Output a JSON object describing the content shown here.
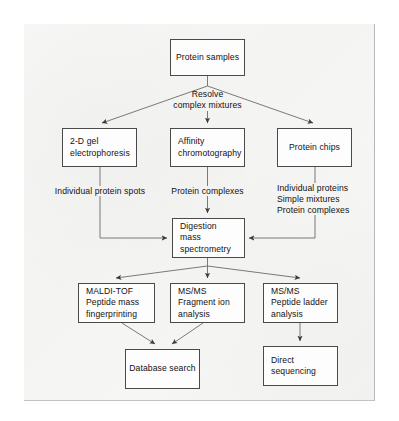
{
  "diagram": {
    "stroke_color": "#4a4a4a",
    "text_color": "#15110f",
    "panel_color": "#f5f5f4",
    "boxes": [
      {
        "id": "protein-samples",
        "lines": [
          "Protein samples"
        ]
      },
      {
        "id": "2d-gel",
        "lines": [
          "2-D gel",
          "electrophoresis"
        ]
      },
      {
        "id": "affinity",
        "lines": [
          "Affinity",
          "chromotography"
        ]
      },
      {
        "id": "protein-chips",
        "lines": [
          "Protein chips"
        ]
      },
      {
        "id": "digestion",
        "lines": [
          "Digestion",
          "mass",
          "spectrometry"
        ]
      },
      {
        "id": "maldi-tof",
        "lines": [
          "MALDI-TOF",
          "Peptide mass",
          "fingerprinting"
        ]
      },
      {
        "id": "msms-fragment",
        "lines": [
          "MS/MS",
          "Fragment ion",
          "analysis"
        ]
      },
      {
        "id": "msms-ladder",
        "lines": [
          "MS/MS",
          "Peptide ladder",
          "analysis"
        ]
      },
      {
        "id": "database-search",
        "lines": [
          "Database search"
        ]
      },
      {
        "id": "direct-sequencing",
        "lines": [
          "Direct",
          "sequencing"
        ]
      }
    ],
    "edge_labels": [
      {
        "id": "resolve",
        "lines": [
          "Resolve",
          "complex mixtures"
        ]
      },
      {
        "id": "individual-spots",
        "lines": [
          "Individual protein spots"
        ]
      },
      {
        "id": "protein-complexes",
        "lines": [
          "Protein complexes"
        ]
      },
      {
        "id": "chip-outputs",
        "lines": [
          "Individual proteins",
          "Simple mixtures",
          "Protein complexes"
        ]
      }
    ]
  }
}
